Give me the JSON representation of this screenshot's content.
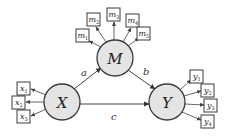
{
  "diagram": {
    "type": "structural-equation-mediation-model",
    "colors": {
      "latent_fill": "#e4e4e4",
      "stroke": "#3a3a3a",
      "background": "#ffffff"
    },
    "latents": {
      "X": {
        "label": "X",
        "cx": 62,
        "cy": 102,
        "r": 18
      },
      "M": {
        "label": "M",
        "cx": 115,
        "cy": 58,
        "r": 18
      },
      "Y": {
        "label": "Y",
        "cx": 167,
        "cy": 102,
        "r": 18
      }
    },
    "paths": {
      "a": {
        "label": "a",
        "from": "X",
        "to": "M"
      },
      "b": {
        "label": "b",
        "from": "M",
        "to": "Y"
      },
      "c": {
        "label": "c",
        "from": "X",
        "to": "Y"
      }
    },
    "indicators": {
      "x": [
        {
          "base": "x",
          "sub": "1"
        },
        {
          "base": "x",
          "sub": "2"
        },
        {
          "base": "x",
          "sub": "3"
        }
      ],
      "m": [
        {
          "base": "m",
          "sub": "1"
        },
        {
          "base": "m",
          "sub": "2"
        },
        {
          "base": "m",
          "sub": "3"
        },
        {
          "base": "m",
          "sub": "4"
        },
        {
          "base": "m",
          "sub": "5"
        }
      ],
      "y": [
        {
          "base": "y",
          "sub": "1"
        },
        {
          "base": "y",
          "sub": "2"
        },
        {
          "base": "y",
          "sub": "3"
        },
        {
          "base": "y",
          "sub": "4"
        }
      ]
    }
  }
}
